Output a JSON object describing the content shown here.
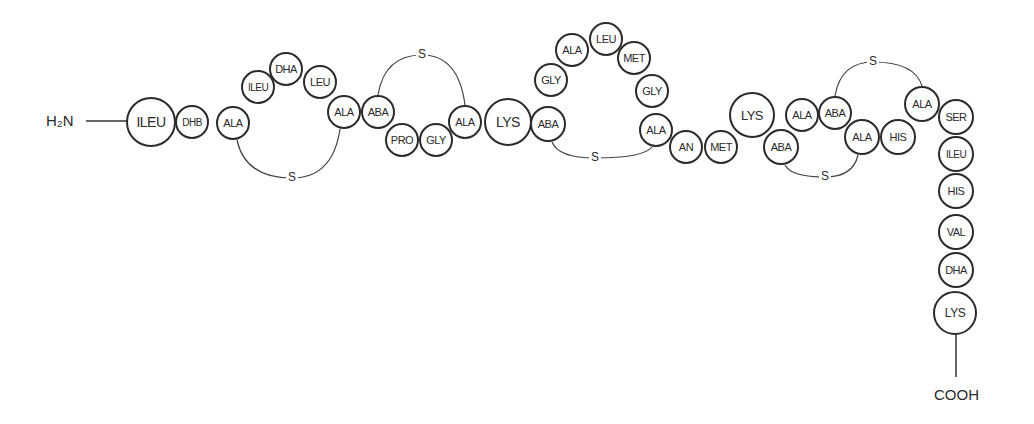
{
  "termini": {
    "n_terminus": "H₂N",
    "c_terminus": "COOH"
  },
  "bridge_label": "S",
  "residues": [
    {
      "label": "ILEU",
      "x": 151,
      "y": 122,
      "r": 25,
      "fs": 14
    },
    {
      "label": "DHB",
      "x": 192,
      "y": 122,
      "r": 17,
      "fs": 10
    },
    {
      "label": "ALA",
      "x": 233,
      "y": 123,
      "r": 17,
      "fs": 11
    },
    {
      "label": "ILEU",
      "x": 258,
      "y": 87,
      "r": 17,
      "fs": 10
    },
    {
      "label": "DHA",
      "x": 286,
      "y": 69,
      "r": 17,
      "fs": 11
    },
    {
      "label": "LEU",
      "x": 320,
      "y": 82,
      "r": 17,
      "fs": 11
    },
    {
      "label": "ALA",
      "x": 344,
      "y": 112,
      "r": 17,
      "fs": 11
    },
    {
      "label": "ABA",
      "x": 378,
      "y": 112,
      "r": 17,
      "fs": 11
    },
    {
      "label": "PRO",
      "x": 402,
      "y": 140,
      "r": 17,
      "fs": 11
    },
    {
      "label": "GLY",
      "x": 436,
      "y": 140,
      "r": 17,
      "fs": 11
    },
    {
      "label": "ALA",
      "x": 465,
      "y": 122,
      "r": 17,
      "fs": 11
    },
    {
      "label": "LYS",
      "x": 508,
      "y": 122,
      "r": 24,
      "fs": 14
    },
    {
      "label": "ABA",
      "x": 548,
      "y": 124,
      "r": 18,
      "fs": 11
    },
    {
      "label": "GLY",
      "x": 551,
      "y": 80,
      "r": 17,
      "fs": 11
    },
    {
      "label": "ALA",
      "x": 572,
      "y": 50,
      "r": 17,
      "fs": 11
    },
    {
      "label": "LEU",
      "x": 606,
      "y": 39,
      "r": 17,
      "fs": 11
    },
    {
      "label": "MET",
      "x": 634,
      "y": 58,
      "r": 17,
      "fs": 11
    },
    {
      "label": "GLY",
      "x": 652,
      "y": 91,
      "r": 17,
      "fs": 11
    },
    {
      "label": "ALA",
      "x": 656,
      "y": 130,
      "r": 17,
      "fs": 11
    },
    {
      "label": "AN",
      "x": 686,
      "y": 147,
      "r": 17,
      "fs": 11
    },
    {
      "label": "MET",
      "x": 721,
      "y": 147,
      "r": 17,
      "fs": 11
    },
    {
      "label": "LYS",
      "x": 752,
      "y": 115,
      "r": 23,
      "fs": 13
    },
    {
      "label": "ABA",
      "x": 781,
      "y": 147,
      "r": 18,
      "fs": 11
    },
    {
      "label": "ALA",
      "x": 802,
      "y": 115,
      "r": 17,
      "fs": 11
    },
    {
      "label": "ABA",
      "x": 835,
      "y": 113,
      "r": 17,
      "fs": 11
    },
    {
      "label": "ALA",
      "x": 862,
      "y": 137,
      "r": 18,
      "fs": 11
    },
    {
      "label": "HIS",
      "x": 898,
      "y": 137,
      "r": 18,
      "fs": 11
    },
    {
      "label": "ALA",
      "x": 922,
      "y": 104,
      "r": 18,
      "fs": 11
    },
    {
      "label": "SER",
      "x": 956,
      "y": 117,
      "r": 18,
      "fs": 11
    },
    {
      "label": "ILEU",
      "x": 956,
      "y": 154,
      "r": 18,
      "fs": 10
    },
    {
      "label": "HIS",
      "x": 956,
      "y": 191,
      "r": 18,
      "fs": 11
    },
    {
      "label": "VAL",
      "x": 956,
      "y": 232,
      "r": 18,
      "fs": 11
    },
    {
      "label": "DHA",
      "x": 956,
      "y": 270,
      "r": 18,
      "fs": 11
    },
    {
      "label": "LYS",
      "x": 955,
      "y": 313,
      "r": 22,
      "fs": 12
    }
  ],
  "bridges": [
    {
      "from": 2,
      "to": 6,
      "s_x": 292,
      "s_y": 178,
      "side": "below"
    },
    {
      "from": 7,
      "to": 10,
      "s_x": 422,
      "s_y": 55,
      "side": "above"
    },
    {
      "from": 12,
      "to": 18,
      "s_x": 595,
      "s_y": 158,
      "side": "below"
    },
    {
      "from": 22,
      "to": 25,
      "s_x": 825,
      "s_y": 177,
      "side": "below"
    },
    {
      "from": 24,
      "to": 27,
      "s_x": 873,
      "s_y": 62,
      "side": "above"
    }
  ]
}
